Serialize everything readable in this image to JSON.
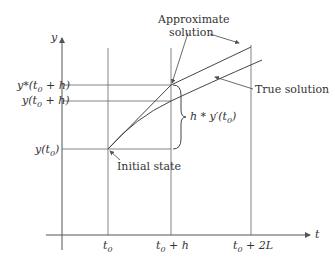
{
  "diagram": {
    "axes": {
      "y_label": "y",
      "t_label": "t"
    },
    "t_ticks": [
      {
        "id": "t0",
        "base": "t",
        "sub": "0",
        "suffix": ""
      },
      {
        "id": "t0_h",
        "base": "t",
        "sub": "0",
        "suffix": " + h"
      },
      {
        "id": "t0_2L",
        "base": "t",
        "sub": "0",
        "suffix": " + 2L"
      }
    ],
    "y_ticks": [
      {
        "id": "ystar_t0h",
        "base": "y*(t",
        "sub": "0",
        "suffix": " + h)"
      },
      {
        "id": "y_t0h",
        "base": "y(t",
        "sub": "0",
        "suffix": " + h)"
      },
      {
        "id": "y_t0",
        "base": "y(t",
        "sub": "0",
        "suffix": ")"
      }
    ],
    "annotations": {
      "approx_line1": "Approximate",
      "approx_line2": "solution",
      "true_solution": "True solution",
      "initial_state": "Initial state",
      "increment_base": "h * y′(t",
      "increment_sub": "0",
      "increment_suffix": ")"
    },
    "colors": {
      "line": "#555555",
      "text": "#333333"
    }
  }
}
